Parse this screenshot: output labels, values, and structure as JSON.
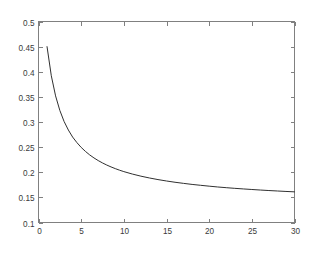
{
  "figure": {
    "background_color": "#ffffff",
    "axes_color": "#808080",
    "tick_label_color": "#3a3a3a"
  },
  "chart_data": {
    "type": "line",
    "title": "",
    "subtitle": "",
    "xlabel": "",
    "ylabel": "",
    "xlim": [
      0,
      30
    ],
    "ylim": [
      0.1,
      0.5
    ],
    "grid": false,
    "legend": null,
    "legend_position": "none",
    "xticks": [
      0,
      5,
      10,
      15,
      20,
      25,
      30
    ],
    "xticklabels": [
      "0",
      "5",
      "10",
      "15",
      "20",
      "25",
      "30"
    ],
    "yticks": [
      0.1,
      0.15,
      0.2,
      0.25,
      0.3,
      0.35,
      0.4,
      0.45,
      0.5
    ],
    "yticklabels": [
      "0.1",
      "0.15",
      "0.2",
      "0.25",
      "0.3",
      "0.35",
      "0.4",
      "0.45",
      "0.5"
    ],
    "series": [
      {
        "name": "curve",
        "color": "#303030",
        "line_width": 1,
        "x": [
          1,
          1.5,
          2,
          2.5,
          3,
          3.5,
          4,
          4.5,
          5,
          5.5,
          6,
          6.5,
          7,
          7.5,
          8,
          8.5,
          9,
          9.5,
          10,
          11,
          12,
          13,
          14,
          15,
          16,
          17,
          18,
          19,
          20,
          21,
          22,
          23,
          24,
          25,
          26,
          27,
          28,
          29,
          30
        ],
        "y": [
          0.45,
          0.392,
          0.352,
          0.323,
          0.301,
          0.284,
          0.27,
          0.259,
          0.2495,
          0.2415,
          0.2345,
          0.2285,
          0.2232,
          0.2185,
          0.2143,
          0.2106,
          0.2072,
          0.2041,
          0.2013,
          0.1964,
          0.1922,
          0.1886,
          0.1854,
          0.1826,
          0.1801,
          0.1779,
          0.1758,
          0.174,
          0.1723,
          0.1707,
          0.1693,
          0.168,
          0.1668,
          0.1657,
          0.1646,
          0.1636,
          0.1627,
          0.1618,
          0.161
        ]
      }
    ]
  }
}
